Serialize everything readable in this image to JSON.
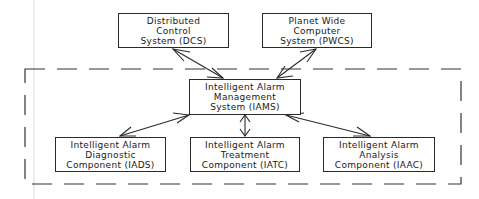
{
  "diagram": {
    "nodes": {
      "dcs": {
        "lines": [
          "Distributed",
          "Control",
          "System (DCS)"
        ]
      },
      "pwcs": {
        "lines": [
          "Planet Wide",
          "Computer",
          "System (PWCS)"
        ]
      },
      "iams": {
        "lines": [
          "Intelligent Alarm",
          "Management",
          "System (IAMS)"
        ]
      },
      "iads": {
        "lines": [
          "Intelligent Alarm",
          "Diagnostic",
          "Component (IADS)"
        ]
      },
      "iatc": {
        "lines": [
          "Intelligent Alarm",
          "Treatment",
          "Component (IATC)"
        ]
      },
      "iaac": {
        "lines": [
          "Intelligent Alarm",
          "Analysis",
          "Component (IAAC)"
        ]
      }
    },
    "edges": [
      {
        "from": "dcs",
        "to": "iams",
        "type": "bidirectional"
      },
      {
        "from": "pwcs",
        "to": "iams",
        "type": "bidirectional"
      },
      {
        "from": "iams",
        "to": "iads",
        "type": "bidirectional"
      },
      {
        "from": "iams",
        "to": "iatc",
        "type": "bidirectional"
      },
      {
        "from": "iams",
        "to": "iaac",
        "type": "bidirectional"
      }
    ],
    "boundary": {
      "style": "dashed",
      "encloses": [
        "iams",
        "iads",
        "iatc",
        "iaac"
      ]
    },
    "colors": {
      "line": "#2a2a2a",
      "background": "#ffffff",
      "faint_rule": "#d8d8d8"
    }
  }
}
